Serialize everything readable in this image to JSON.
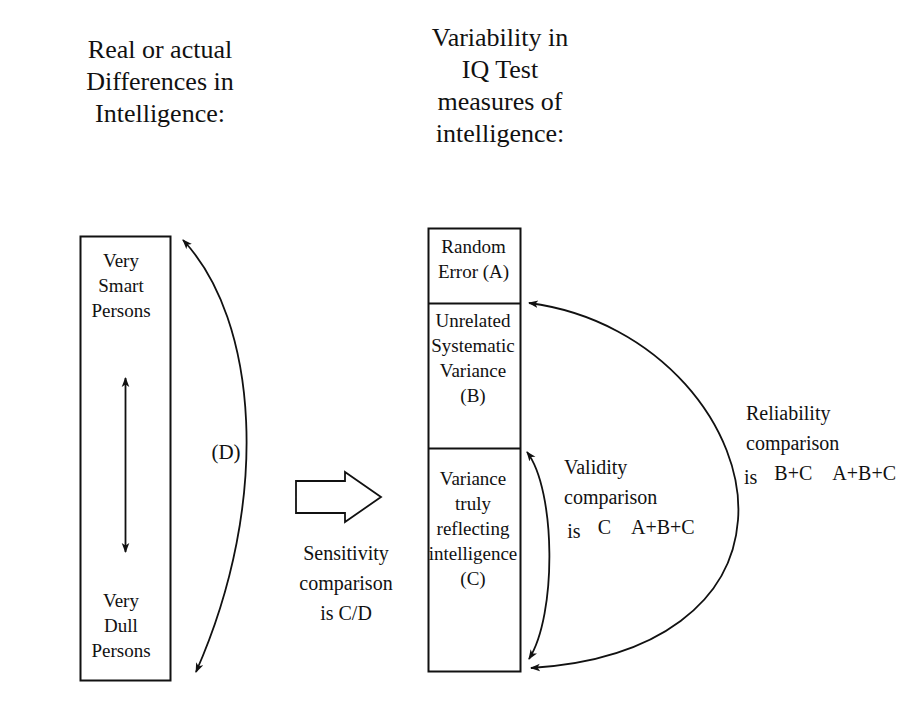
{
  "diagram": {
    "headings": {
      "left": "Real or actual\nDifferences in\nIntelligence:",
      "right": "Variability in\nIQ Test\nmeasures of\nintelligence:"
    },
    "left_box": {
      "top_label": "Very\nSmart\nPersons",
      "bottom_label": "Very\nDull\nPersons"
    },
    "center_box": {
      "segments": [
        {
          "key": "A",
          "label": "Random\nError (A)"
        },
        {
          "key": "B",
          "label": "Unrelated\nSystematic\nVariance\n(B)"
        },
        {
          "key": "C",
          "label": "Variance\ntruly\nreflecting\nintelligence\n(C)"
        }
      ]
    },
    "annotations": {
      "d_label": "(D)",
      "sensitivity": "Sensitivity\ncomparison\nis C/D"
    },
    "comparisons": [
      {
        "name": "validity",
        "title": "Validity\ncomparison",
        "is_label": "is",
        "numerator": "C",
        "denominator": "A+B+C"
      },
      {
        "name": "reliability",
        "title": "Reliability\ncomparison",
        "is_label": "is",
        "numerator": "B+C",
        "denominator": "A+B+C"
      }
    ],
    "colors": {
      "ink": "#111111",
      "background": "#ffffff"
    }
  }
}
